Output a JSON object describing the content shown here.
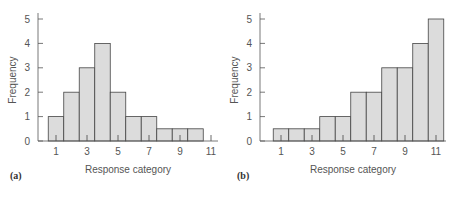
{
  "chart_data": [
    {
      "type": "bar",
      "panel_label": "(a)",
      "title": "",
      "xlabel": "Response category",
      "ylabel": "Frequency",
      "categories": [
        1,
        2,
        3,
        4,
        5,
        6,
        7,
        8,
        9,
        10
      ],
      "values": [
        1,
        2,
        3,
        4,
        2,
        1,
        1,
        0.5,
        0.5,
        0.5
      ],
      "x_ticks": [
        "1",
        "3",
        "5",
        "7",
        "9",
        "11"
      ],
      "y_ticks": [
        "0",
        "1",
        "2",
        "3",
        "4",
        "5"
      ],
      "ylim": [
        0,
        5
      ],
      "xlim": [
        0,
        11.5
      ],
      "grid": false,
      "bar_fill": "#dcdcdc",
      "bar_edge": "#444444"
    },
    {
      "type": "bar",
      "panel_label": "(b)",
      "title": "",
      "xlabel": "Response category",
      "ylabel": "Frequency",
      "categories": [
        1,
        2,
        3,
        4,
        5,
        6,
        7,
        8,
        9,
        10,
        11
      ],
      "values": [
        0.5,
        0.5,
        0.5,
        1,
        1,
        2,
        2,
        3,
        3,
        4,
        5
      ],
      "x_ticks": [
        "1",
        "3",
        "5",
        "7",
        "9",
        "11"
      ],
      "y_ticks": [
        "0",
        "1",
        "2",
        "3",
        "4",
        "5"
      ],
      "ylim": [
        0,
        5
      ],
      "xlim": [
        0,
        11.5
      ],
      "grid": false,
      "bar_fill": "#dcdcdc",
      "bar_edge": "#444444"
    }
  ]
}
